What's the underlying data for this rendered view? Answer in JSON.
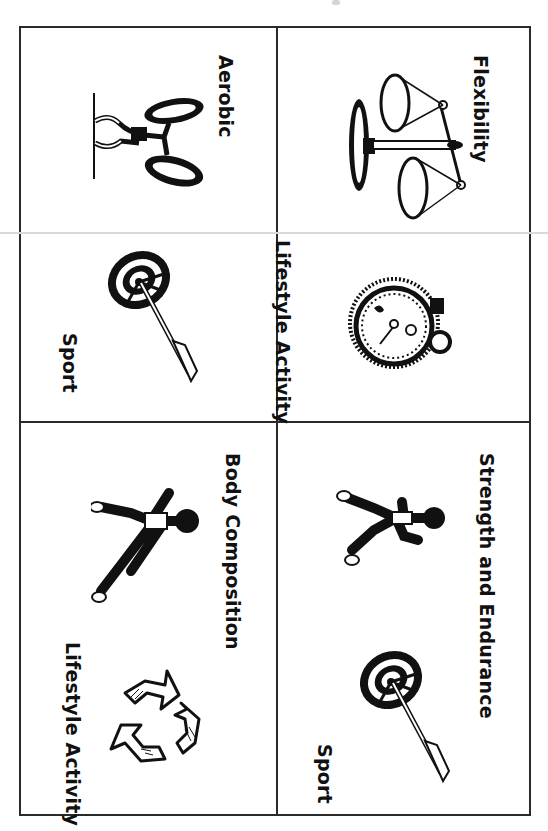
{
  "page": {
    "cards": [
      {
        "id": "flexibility",
        "title": "Flexibility",
        "icon": "balance-scale-icon"
      },
      {
        "id": "aerobic",
        "title": "Aerobic",
        "icon": "cyclist-icon"
      },
      {
        "id": "lifestyle-1",
        "title": "Lifestyle Activity",
        "icon": "stopwatch-icon"
      },
      {
        "id": "sport-1",
        "title": "Sport",
        "icon": "archery-target-icon"
      },
      {
        "id": "strength",
        "title": "Strength and Endurance",
        "icon": "runner-icon"
      },
      {
        "id": "body-composition",
        "title": "Body Composition",
        "icon": "sprinter-icon"
      },
      {
        "id": "sport-2",
        "title": "Sport",
        "icon": "archery-target-icon"
      },
      {
        "id": "lifestyle-2",
        "title": "Lifestyle Activity",
        "icon": "recycle-icon"
      }
    ]
  }
}
